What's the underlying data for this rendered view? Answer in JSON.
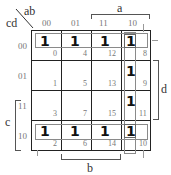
{
  "kmap": {
    "corner": {
      "row_vars": "cd",
      "col_vars": "ab"
    },
    "col_labels": [
      "00",
      "01",
      "11",
      "10"
    ],
    "row_labels": [
      "00",
      "01",
      "11",
      "10"
    ],
    "cells": [
      [
        {
          "value": "1",
          "index": "0"
        },
        {
          "value": "1",
          "index": "4"
        },
        {
          "value": "1",
          "index": "12"
        },
        {
          "value": "1",
          "index": "8"
        }
      ],
      [
        {
          "value": "",
          "index": "1"
        },
        {
          "value": "",
          "index": "5"
        },
        {
          "value": "",
          "index": "13"
        },
        {
          "value": "1",
          "index": "9"
        }
      ],
      [
        {
          "value": "",
          "index": "3"
        },
        {
          "value": "",
          "index": "7"
        },
        {
          "value": "",
          "index": "15"
        },
        {
          "value": "1",
          "index": "11"
        }
      ],
      [
        {
          "value": "1",
          "index": "2"
        },
        {
          "value": "1",
          "index": "6"
        },
        {
          "value": "1",
          "index": "14"
        },
        {
          "value": "1",
          "index": "10"
        }
      ]
    ],
    "brackets": {
      "a": "a",
      "b": "b",
      "c": "c",
      "d": "d"
    },
    "groups": [
      {
        "name": "row-00",
        "cells": [
          0,
          4,
          12,
          8
        ]
      },
      {
        "name": "row-10",
        "cells": [
          2,
          6,
          14,
          10
        ]
      },
      {
        "name": "col-10",
        "cells": [
          8,
          9,
          11,
          10
        ]
      }
    ]
  }
}
